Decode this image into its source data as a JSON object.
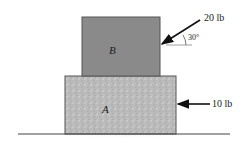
{
  "diagram": {
    "block_b": {
      "label": "B",
      "fill": "#8a8a8a"
    },
    "block_a": {
      "label": "A",
      "fill": "#b9b9b9"
    },
    "force_top": {
      "label": "20 lb",
      "angle_label": "30°"
    },
    "force_side": {
      "label": "10 lb"
    },
    "ground": {
      "line_color": "#444444"
    }
  }
}
